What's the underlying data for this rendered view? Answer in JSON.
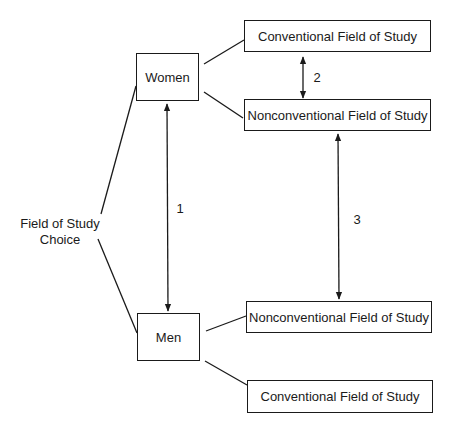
{
  "diagram": {
    "root": {
      "label_line1": "Field of Study",
      "label_line2": "Choice"
    },
    "groups": {
      "women": "Women",
      "men": "Men"
    },
    "outcomes": {
      "women_conventional": "Conventional Field of Study",
      "women_nonconventional": "Nonconventional Field of Study",
      "men_nonconventional": "Nonconventional Field of Study",
      "men_conventional": "Conventional Field of Study"
    },
    "comparisons": [
      {
        "id": "1",
        "label": "1",
        "between": [
          "Women",
          "Men"
        ]
      },
      {
        "id": "2",
        "label": "2",
        "between": [
          "Women Conventional",
          "Women Nonconventional"
        ]
      },
      {
        "id": "3",
        "label": "3",
        "between": [
          "Women Nonconventional",
          "Men Nonconventional"
        ]
      }
    ]
  }
}
